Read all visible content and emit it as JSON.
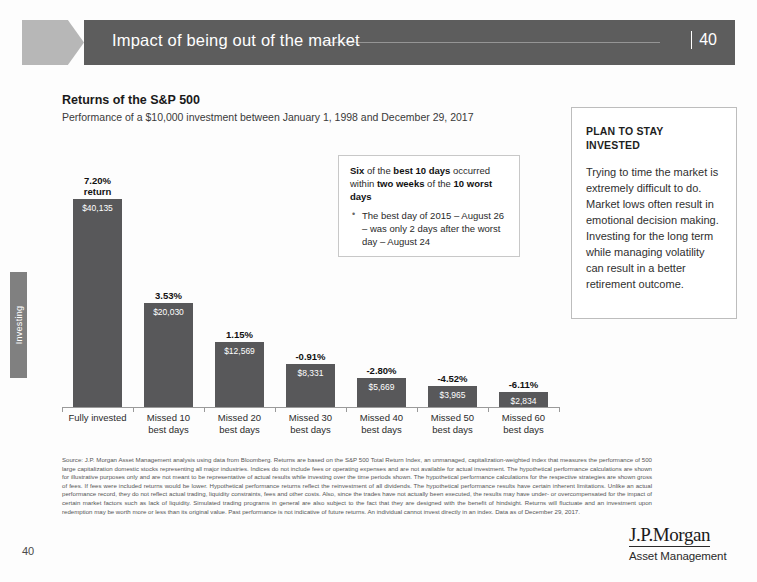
{
  "header": {
    "title": "Impact of being out of the market",
    "page_number": "40",
    "separator": "|"
  },
  "side_tab": {
    "label": "Investing"
  },
  "chart_heading": {
    "title": "Returns of the S&P 500",
    "subtitle": "Performance of a $10,000 investment between January 1, 1998 and December 29, 2017"
  },
  "chart_data": {
    "type": "bar",
    "title": "Returns of the S&P 500",
    "subtitle": "Performance of a $10,000 investment between January 1, 1998 and December 29, 2017",
    "xlabel": "",
    "ylabel": "",
    "grid": false,
    "legend": "none",
    "ylim": [
      0,
      40135
    ],
    "categories": [
      "Fully invested",
      "Missed 10\nbest days",
      "Missed 20\nbest days",
      "Missed 30\nbest days",
      "Missed 40\nbest days",
      "Missed 50\nbest days",
      "Missed 60\nbest days"
    ],
    "values": [
      40135,
      20030,
      12569,
      8331,
      5669,
      3965,
      2834
    ],
    "value_labels": [
      "$40,135",
      "$20,030",
      "$12,569",
      "$8,331",
      "$5,669",
      "$3,965",
      "$2,834"
    ],
    "annual_return_labels": [
      "7.20%\nreturn",
      "3.53%",
      "1.15%",
      "-0.91%",
      "-2.80%",
      "-4.52%",
      "-6.11%"
    ],
    "annual_returns_pct": [
      7.2,
      3.53,
      1.15,
      -0.91,
      -2.8,
      -4.52,
      -6.11
    ],
    "bar_color": "#58585a"
  },
  "callout": {
    "lead_html": "<b>Six</b> of the <b>best 10 days</b> occurred within <b>two weeks</b> of the <b>10 worst days</b>",
    "bullets": [
      "The best day of 2015 – August 26 – was only 2 days after the worst day – August 24"
    ]
  },
  "sidebox": {
    "heading": "PLAN TO STAY\nINVESTED",
    "body": "Trying to time the market is extremely difficult to do. Market lows often result in emotional decision making. Investing for the long term while managing volatility can result in a better retirement outcome."
  },
  "footnote": {
    "text": "Source: J.P. Morgan Asset Management analysis using data from Bloomberg. Returns are based on the S&P 500 Total Return Index, an unmanaged, capitalization-weighted index that measures the performance of 500 large capitalization domestic stocks representing all major industries. Indices do not include fees or operating expenses and are not available for actual investment. The hypothetical performance calculations are shown for illustrative purposes only and are not meant to be representative of actual results while investing over the time periods shown. The hypothetical performance calculations for the respective strategies are shown gross of fees. If fees were included returns would be lower. Hypothetical performance returns reflect the reinvestment of all dividends. The hypothetical performance results have certain inherent limitations. Unlike an actual performance record, they do not reflect actual trading, liquidity constraints, fees and other costs. Also, since the trades have not actually been executed, the results may have under- or overcompensated for the impact of certain market factors such as lack of liquidity. Simulated trading programs in general are also subject to the fact that they are designed with the benefit of hindsight. Returns will fluctuate and an investment upon redemption may be worth more or less than its original value. Past performance is not indicative of future returns. An individual cannot invest directly in an index. Data as of December 29, 2017."
  },
  "footer": {
    "page_number": "40",
    "logo_mark": "J.P.Morgan",
    "logo_sub": "Asset Management"
  }
}
